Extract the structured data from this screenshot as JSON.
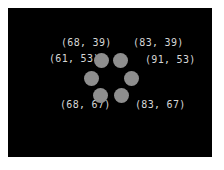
{
  "figure": {
    "background": "#000000",
    "label_color": "#d6d6d6",
    "dot_color": "#8e8e8e",
    "labels": [
      {
        "text": "(68, 39)"
      },
      {
        "text": "(83, 39)"
      },
      {
        "text": "(61, 53)"
      },
      {
        "text": "(91, 53)"
      },
      {
        "text": "(68, 67)"
      },
      {
        "text": "(83, 67)"
      }
    ],
    "dots": [
      {
        "cx": 101,
        "cy": 60
      },
      {
        "cx": 120,
        "cy": 60
      },
      {
        "cx": 91,
        "cy": 78
      },
      {
        "cx": 131,
        "cy": 78
      },
      {
        "cx": 100,
        "cy": 95
      },
      {
        "cx": 121,
        "cy": 95
      }
    ]
  }
}
